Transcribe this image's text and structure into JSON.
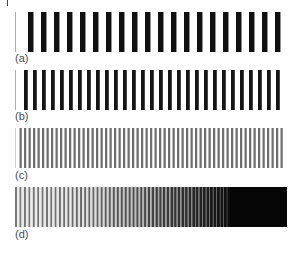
{
  "figure": {
    "panels": [
      {
        "id": "a",
        "label": "(a)",
        "bars": 21,
        "period_px": 13.0,
        "duty": 0.42,
        "bar_color": "#111111",
        "first_bar_faint": true,
        "gradient_to_black": false
      },
      {
        "id": "b",
        "label": "(b)",
        "bars": 30,
        "period_px": 9.0,
        "duty": 0.42,
        "bar_color": "#151515",
        "first_bar_faint": true,
        "gradient_to_black": false
      },
      {
        "id": "c",
        "label": "(c)",
        "bars": 60,
        "period_px": 4.5,
        "duty": 0.5,
        "bar_color": "#6e6e6e",
        "first_bar_faint": true,
        "gradient_to_black": false
      },
      {
        "id": "d",
        "label": "(d)",
        "bars": 0,
        "period_px": 4.5,
        "duty": 0.5,
        "bar_color": "#777777",
        "first_bar_faint": false,
        "gradient_to_black": true,
        "solid_black_from_px": 215
      }
    ]
  },
  "colors": {
    "background": "#ffffff",
    "label_text": "#4a4a4a",
    "dark_bar": "#111111",
    "black": "#050505"
  }
}
